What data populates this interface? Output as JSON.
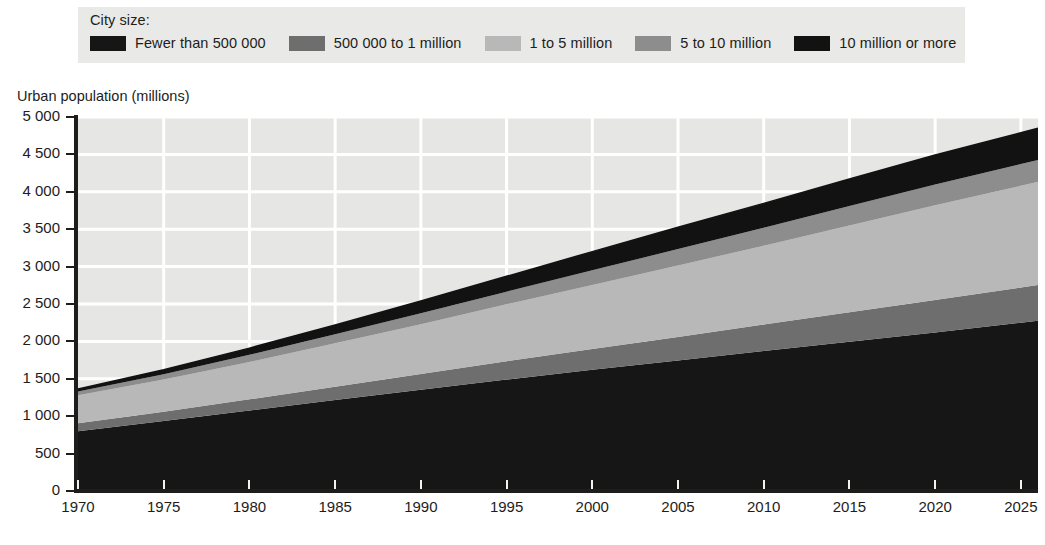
{
  "legend": {
    "title": "City size:",
    "items": [
      {
        "label": "Fewer than 500 000",
        "color": "#161616"
      },
      {
        "label": "500 000 to 1 million",
        "color": "#6e6e6e"
      },
      {
        "label": "1 to 5 million",
        "color": "#b8b8b8"
      },
      {
        "label": "5 to 10 million",
        "color": "#8d8d8d"
      },
      {
        "label": "10 million or more",
        "color": "#121212"
      }
    ]
  },
  "axes": {
    "y_title": "Urban population (millions)",
    "y_ticks": [
      "0",
      "500",
      "1 000",
      "1 500",
      "2 000",
      "2 500",
      "3 000",
      "3 500",
      "4 000",
      "4 500",
      "5 000"
    ],
    "x_ticks": [
      "1970",
      "1975",
      "1980",
      "1985",
      "1990",
      "1995",
      "2000",
      "2005",
      "2010",
      "2015",
      "2020",
      "2025"
    ]
  },
  "chart_data": {
    "type": "area",
    "title": "",
    "xlabel": "",
    "ylabel": "Urban population (millions)",
    "ylim": [
      0,
      5000
    ],
    "xlim": [
      1970,
      2026
    ],
    "grid": true,
    "stacked": true,
    "legend_position": "top",
    "x": [
      1970,
      1975,
      1980,
      1985,
      1990,
      1995,
      2000,
      2005,
      2010,
      2015,
      2020,
      2025,
      2026
    ],
    "series": [
      {
        "name": "Fewer than 500 000",
        "color": "#161616",
        "values": [
          800,
          935,
          1075,
          1215,
          1355,
          1490,
          1620,
          1745,
          1870,
          1995,
          2120,
          2250,
          2275
        ]
      },
      {
        "name": "500 000 to 1 million",
        "color": "#6e6e6e",
        "values": [
          105,
          125,
          150,
          180,
          210,
          245,
          280,
          315,
          355,
          395,
          435,
          470,
          478
        ]
      },
      {
        "name": "1 to 5 million",
        "color": "#b8b8b8",
        "values": [
          375,
          430,
          500,
          580,
          665,
          760,
          855,
          955,
          1055,
          1160,
          1265,
          1360,
          1380
        ]
      },
      {
        "name": "5 to 10 million",
        "color": "#8d8d8d",
        "values": [
          50,
          70,
          95,
          120,
          145,
          170,
          195,
          220,
          240,
          260,
          278,
          290,
          293
        ]
      },
      {
        "name": "10 million or more",
        "color": "#121212",
        "values": [
          35,
          60,
          90,
          125,
          165,
          205,
          250,
          290,
          325,
          360,
          395,
          420,
          425
        ]
      }
    ],
    "totals": [
      1365,
      1620,
      1910,
      2220,
      2540,
      2870,
      3200,
      3525,
      3845,
      4170,
      4493,
      4790,
      4851
    ]
  }
}
